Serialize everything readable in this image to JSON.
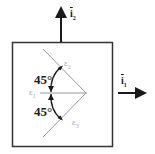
{
  "diagram": {
    "type": "strain-rosette-45deg",
    "frame": {
      "color": "#333333"
    },
    "axes": {
      "vertical": {
        "label": "i",
        "subscript": "2",
        "overbar": true
      },
      "horizontal": {
        "label": "i",
        "subscript": "1",
        "overbar": true
      }
    },
    "gauges": [
      {
        "id": "e1",
        "label": "ε",
        "subscript": "1",
        "orientation": "0°"
      },
      {
        "id": "e2",
        "label": "ε",
        "subscript": "2",
        "orientation": "+45°"
      },
      {
        "id": "e3",
        "label": "ε",
        "subscript": "3",
        "orientation": "-45°"
      }
    ],
    "angles": [
      {
        "label": "45°",
        "between": [
          "e1",
          "e2"
        ]
      },
      {
        "label": "45°",
        "between": [
          "e1",
          "e3"
        ]
      }
    ],
    "colors": {
      "gauge_line": "#999999",
      "arrow": "#1a1a1a",
      "label_gray": "#aaaaaa"
    }
  }
}
